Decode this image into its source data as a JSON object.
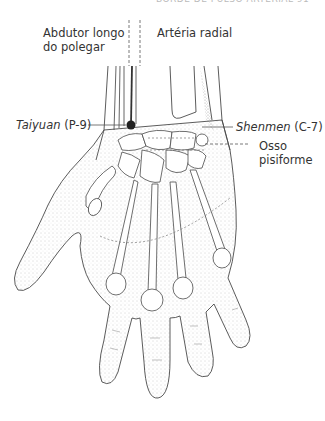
{
  "header": {
    "running_head_cut": "BORDE DE PULSO ARTERIAL 91"
  },
  "figure": {
    "labels": {
      "abductor_line1": "Abdutor longo",
      "abductor_line2": "do polegar",
      "radial_artery": "Artéria radial",
      "taiyuan_name": "Taiyuan",
      "taiyuan_code": "(P-9)",
      "shenmen_name": "Shenmen",
      "shenmen_code": "(C-7)",
      "pisiform_line1": "Osso",
      "pisiform_line2": "pisiforme"
    },
    "colors": {
      "line": "#4a4a4a",
      "stipple": "#9a9a9a",
      "point": "#222222",
      "text": "#333333"
    }
  }
}
